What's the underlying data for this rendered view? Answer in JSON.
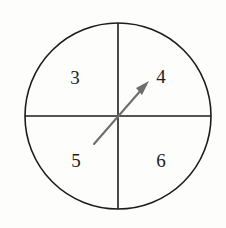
{
  "figure": {
    "type": "quadrant-circle-diagram",
    "background_color": "#fdfdfc",
    "stroke_color": "#1c1c1c",
    "arrow_color": "#6e6e6e",
    "circle": {
      "center_x": 118,
      "center_y": 116,
      "radius": 93,
      "stroke_width": 1.6
    },
    "diameters": [
      {
        "name": "vertical-diameter",
        "x1": 118,
        "y1": 23,
        "x2": 118,
        "y2": 209
      },
      {
        "name": "horizontal-diameter",
        "x1": 25,
        "y1": 116,
        "x2": 211,
        "y2": 116
      }
    ],
    "arrow": {
      "tail_x": 94,
      "tail_y": 144,
      "tip_x": 149,
      "tip_y": 81,
      "stroke_width": 2.1,
      "head_length": 17,
      "head_half_width": 4.6,
      "points_into_quadrant": "4"
    },
    "quadrants": [
      {
        "name": "top-left",
        "label": "3",
        "label_x": 75,
        "label_y": 78
      },
      {
        "name": "top-right",
        "label": "4",
        "label_x": 161,
        "label_y": 77
      },
      {
        "name": "bottom-left",
        "label": "5",
        "label_x": 76,
        "label_y": 161
      },
      {
        "name": "bottom-right",
        "label": "6",
        "label_x": 161,
        "label_y": 161
      }
    ],
    "ghost_showthrough": {
      "line_1": "",
      "line_2": ""
    }
  }
}
